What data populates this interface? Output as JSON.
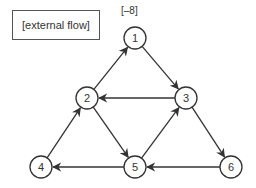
{
  "diagram": {
    "external_label": "[external flow]",
    "supply_label": "[–8]",
    "stroke_color": "#333333",
    "nodes": [
      {
        "id": "1",
        "label": "1",
        "x": 135,
        "y": 38
      },
      {
        "id": "2",
        "label": "2",
        "x": 87,
        "y": 98
      },
      {
        "id": "3",
        "label": "3",
        "x": 186,
        "y": 98
      },
      {
        "id": "4",
        "label": "4",
        "x": 41,
        "y": 167
      },
      {
        "id": "5",
        "label": "5",
        "x": 135,
        "y": 167
      },
      {
        "id": "6",
        "label": "6",
        "x": 231,
        "y": 167
      }
    ],
    "edges": [
      {
        "from": "2",
        "to": "1"
      },
      {
        "from": "1",
        "to": "3"
      },
      {
        "from": "3",
        "to": "2"
      },
      {
        "from": "2",
        "to": "5"
      },
      {
        "from": "5",
        "to": "3"
      },
      {
        "from": "3",
        "to": "6"
      },
      {
        "from": "6",
        "to": "5"
      },
      {
        "from": "5",
        "to": "4"
      },
      {
        "from": "4",
        "to": "2"
      }
    ]
  }
}
